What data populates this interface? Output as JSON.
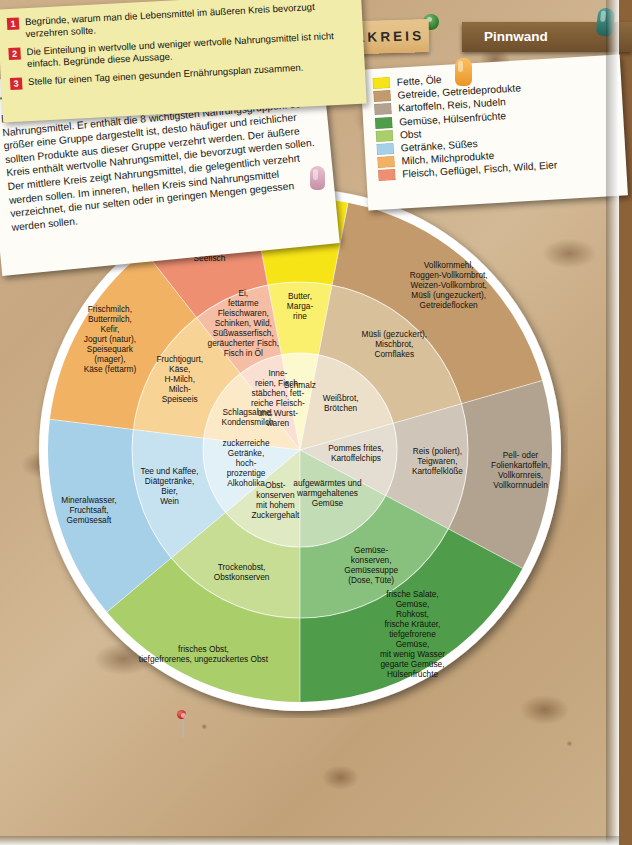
{
  "board": {
    "title": "LEBENSMITTELKREIS",
    "tab_label": "Pinnwand"
  },
  "intro": {
    "heading": "Lebensmittelkreis",
    "body": "Der Lebensmittelkreis hilft bei der Zusammenstellung gesunder Nahrungsmittel. Er enthält die 8 wichtigsten Nahrungsgruppen. Je größer eine Gruppe dargestellt ist, desto häufiger und reichlicher sollten Produkte aus dieser Gruppe verzehrt werden. Der äußere Kreis enthält wertvolle Nahrungsmittel, die bevorzugt werden sollen. Der mittlere Kreis zeigt Nahrungsmittel, die gelegentlich verzehrt werden sollen. Im inneren, hellen Kreis sind Nahrungsmittel verzeichnet, die nur selten oder in geringen Mengen gegessen werden sollen."
  },
  "legend": {
    "items": [
      {
        "color": "#f7e417",
        "label": "Fette, Öle"
      },
      {
        "color": "#c39a6b",
        "label": "Getreide, Getreideprodukte"
      },
      {
        "color": "#b2a391",
        "label": "Kartoffeln, Reis, Nudeln"
      },
      {
        "color": "#4f9d4a",
        "label": "Gemüse, Hülsenfrüchte"
      },
      {
        "color": "#a9ce6a",
        "label": "Obst"
      },
      {
        "color": "#a6cfe8",
        "label": "Getränke, Süßes"
      },
      {
        "color": "#f2b263",
        "label": "Milch, Milchprodukte"
      },
      {
        "color": "#ef8f72",
        "label": "Fleisch, Geflügel, Fisch, Wild, Eier"
      }
    ]
  },
  "tasks": [
    {
      "num": "1",
      "text": "Begründe, warum man die Lebensmittel im äußeren Kreis bevorzugt verzehren sollte."
    },
    {
      "num": "2",
      "text": "Die Einteilung in wertvolle und weniger wertvolle Nahrungsmittel ist nicht einfach. Begründe diese Aussage."
    },
    {
      "num": "3",
      "text": "Stelle für einen Tag einen gesunden Ernährungsplan zusammen."
    }
  ],
  "chart_data": {
    "type": "pie",
    "title": "Lebensmittelkreis",
    "subtitle": "8 Nahrungsgruppen in drei Ringen (innen = selten, außen = bevorzugt)",
    "rings": [
      "innen (selten / geringe Mengen)",
      "mitte (gelegentlich)",
      "außen (bevorzugt)"
    ],
    "inner_radius": 0,
    "mid_radius": 97,
    "outer_radius": 168,
    "rim_radius": 260,
    "center": [
      267,
      267
    ],
    "legend_position": "top-right",
    "total_segments": 8,
    "segments": [
      {
        "name": "Fette, Öle",
        "color_outer": "#f7e417",
        "color_mid": "#fbf06e",
        "color_inner": "#fdf9cf",
        "start_angle_deg": -101,
        "end_angle_deg": -79,
        "share_pct": 6.1,
        "outer_label": "Pflanzenöle",
        "mid_label": "Butter,\nMarga-\nrine",
        "inner_label": "Schmalz"
      },
      {
        "name": "Getreide, Getreideprodukte",
        "color_outer": "#c39a6b",
        "color_mid": "#d8c09a",
        "color_inner": "#ece0cb",
        "start_angle_deg": -79,
        "end_angle_deg": -16,
        "share_pct": 17.5,
        "outer_label": "Vollkornmehl,\nRoggen-Vollkornbrot,\nWeizen-Vollkornbrot,\nMüsli (ungezuckert),\nGetreideflocken",
        "mid_label": "Müsli (gezuckert),\nMischbrot,\nCornflakes",
        "inner_label": "Weißbrot,\nBrötchen"
      },
      {
        "name": "Kartoffeln, Reis, Nudeln",
        "color_outer": "#b2a391",
        "color_mid": "#cfc6b9",
        "color_inner": "#e3ddd2",
        "start_angle_deg": -16,
        "end_angle_deg": 28,
        "share_pct": 12.2,
        "outer_label": "Pell- oder\nFolienkartoffeln,\nVollkornreis,\nVollkornnudeln",
        "mid_label": "Reis (poliert),\nTeigwaren,\nKartoffelklöße",
        "inner_label": "Pommes frites,\nKartoffelchips"
      },
      {
        "name": "Gemüse, Hülsenfrüchte",
        "color_outer": "#4f9d4a",
        "color_mid": "#88c07e",
        "color_inner": "#c2dcb5",
        "start_angle_deg": 28,
        "end_angle_deg": 90,
        "share_pct": 17.2,
        "outer_label": "frische Salate,\nGemüse,\nRohkost,\nfrische Kräuter,\ntiefgefrorene\nGemüse,\nmit wenig Wasser\ngegarte Gemüse,\nHülsenfrüchte",
        "mid_label": "Gemüse-\nkonserven,\nGemüsesuppe\n(Dose, Tüte)",
        "inner_label": "aufgewärmtes und\nwarmgehaltenes\nGemüse"
      },
      {
        "name": "Obst",
        "color_outer": "#a9ce6a",
        "color_mid": "#c6dd93",
        "color_inner": "#dfeac3",
        "start_angle_deg": 90,
        "end_angle_deg": 140,
        "share_pct": 13.9,
        "outer_label": "frisches Obst,\ntiefgefrorenes, ungezuckertes Obst",
        "mid_label": "Trockenobst,\nObstkonserven",
        "inner_label": "Obst-\nkonserven\nmit hohem\nZuckergehalt"
      },
      {
        "name": "Getränke, Süßes",
        "color_outer": "#a6cfe8",
        "color_mid": "#c6e2f1",
        "color_inner": "#e2f0f8",
        "start_angle_deg": 140,
        "end_angle_deg": 187,
        "share_pct": 13.1,
        "outer_label": "Mineralwasser,\nFruchtsaft,\nGemüsesaft",
        "mid_label": "Tee und Kaffee,\nDiätgetränke,\nBier,\nWein",
        "inner_label": "zuckerreiche\nGetränke,\nhoch-\nprozentige\nAlkoholika"
      },
      {
        "name": "Milch, Milchprodukte",
        "color_outer": "#f2b263",
        "color_mid": "#f8d396",
        "color_inner": "#fbe9c8",
        "start_angle_deg": 187,
        "end_angle_deg": 232,
        "share_pct": 12.5,
        "outer_label": "Frischmilch,\nButtermilch,\nKefir,\nJogurt (natur),\nSpeisequark\n(mager),\nKäse (fettarm)",
        "mid_label": "Fruchtjogurt,\nKäse,\nH-Milch,\nMilch-\nSpeiseeis",
        "inner_label": "Schlagsahne,\nKondensmilch"
      },
      {
        "name": "Fleisch, Geflügel, Fisch, Wild, Eier",
        "color_outer": "#ef8f72",
        "color_mid": "#f6bda5",
        "color_inner": "#fae0d2",
        "start_angle_deg": 232,
        "end_angle_deg": 259,
        "share_pct": 7.5,
        "outer_label": "mageres Fleisch\nund Geflügel,\nSeefisch",
        "mid_label": "Ei,\nfettarme\nFleischwaren,\nSchinken, Wild,\nSüßwasserfisch,\ngeräucherter Fisch,\nFisch in Öl",
        "inner_label": "Inne-\nreien, Fisch-\nstäbchen, fett-\nreiche Fleisch-\nund Wurst-\nwaren"
      }
    ]
  },
  "pins": [
    {
      "name": "pin-black",
      "color": "#1d1d1d"
    },
    {
      "name": "pin-green",
      "color": "#3f8a3a"
    },
    {
      "name": "pin-orange",
      "color": "#e8753a"
    },
    {
      "name": "pin-orange2",
      "color": "#f0a12e"
    },
    {
      "name": "pin-pink",
      "color": "#d9a7bd"
    },
    {
      "name": "pin-red",
      "color": "#cf3326"
    },
    {
      "name": "pin-teal",
      "color": "#2f7a6e"
    }
  ]
}
